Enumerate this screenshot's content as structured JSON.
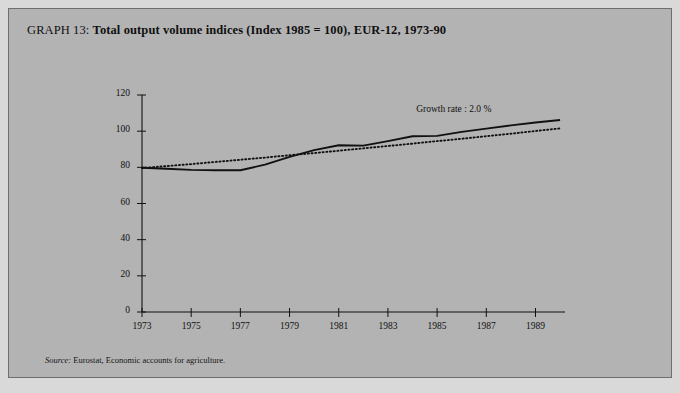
{
  "figure": {
    "graph_number_label": "GRAPH 13:",
    "title_main": "Total output volume indices (Index 1985 = 100), EUR-12, 1973-90",
    "source_label": "Source:",
    "source_text": "Eurostat, Economic accounts for agriculture.",
    "panel_color": "#b3b3b3",
    "page_color": "#d9d9d9",
    "ink_color": "#111111"
  },
  "chart_data": {
    "type": "line",
    "title": "Total output volume indices (Index 1985 = 100), EUR-12, 1973-90",
    "xlabel": "",
    "ylabel": "",
    "xlim": [
      1973,
      1990.2
    ],
    "ylim": [
      0,
      120
    ],
    "yticks": [
      0,
      20,
      40,
      60,
      80,
      100,
      120
    ],
    "ytick_labels": [
      "0",
      "20",
      "40",
      "60",
      "80",
      "100",
      "120"
    ],
    "xticks": [
      1973,
      1975,
      1977,
      1979,
      1981,
      1983,
      1985,
      1987,
      1989
    ],
    "xtick_labels": [
      "1973",
      "1975",
      "1977",
      "1979",
      "1981",
      "1983",
      "1985",
      "1987",
      "1989"
    ],
    "grid": false,
    "legend": "none",
    "annotations": [
      {
        "text": "Growth rate : 2.0 %",
        "x": 1986.1,
        "y": 110.5
      }
    ],
    "x": [
      1973,
      1974,
      1975,
      1976,
      1977,
      1978,
      1979,
      1980,
      1981,
      1982,
      1983,
      1984,
      1985,
      1986,
      1987,
      1988,
      1989,
      1990
    ],
    "series": [
      {
        "name": "Total output volume index",
        "style": "solid",
        "values": [
          79.8,
          79.2,
          78.6,
          78.4,
          78.4,
          81.5,
          85.8,
          89.5,
          92.2,
          92.0,
          94.5,
          97.2,
          97.4,
          99.6,
          101.4,
          103.2,
          104.8,
          106.2
        ]
      },
      {
        "name": "Trend (growth rate 2.0 %)",
        "style": "dotted",
        "values": [
          79.6,
          80.7,
          81.8,
          83.0,
          84.2,
          85.4,
          86.7,
          87.9,
          89.2,
          90.5,
          91.8,
          93.1,
          94.5,
          95.8,
          97.2,
          98.6,
          100.1,
          101.5
        ]
      }
    ]
  }
}
